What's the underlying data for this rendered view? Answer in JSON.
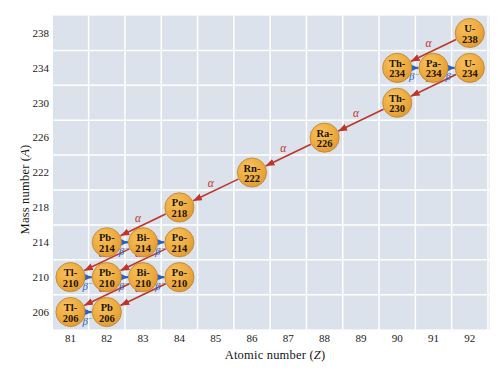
{
  "figure": {
    "xlabel_prefix": "Atomic number (",
    "xlabel_var": "Z",
    "xlabel_suffix": ")",
    "ylabel_prefix": "Mass number (",
    "ylabel_var": "A",
    "ylabel_suffix": ")"
  },
  "chart_data": {
    "type": "scatter",
    "xlabel": "Atomic number (Z)",
    "ylabel": "Mass number (A)",
    "xlim": [
      80.5,
      92.5
    ],
    "ylim": [
      204,
      240
    ],
    "grid": true,
    "x_ticks": [
      81,
      82,
      83,
      84,
      85,
      86,
      87,
      88,
      89,
      90,
      91,
      92
    ],
    "y_ticks": [
      238,
      234,
      230,
      226,
      222,
      218,
      214,
      210,
      206
    ],
    "decay_labels": {
      "alpha": "α",
      "beta": "β",
      "beta_superscript": "−"
    },
    "nuclides": [
      {
        "name": "U-238",
        "line1": "U-",
        "line2": "238",
        "z": 92,
        "a": 238
      },
      {
        "name": "Th-234",
        "line1": "Th-",
        "line2": "234",
        "z": 90,
        "a": 234
      },
      {
        "name": "Pa-234",
        "line1": "Pa-",
        "line2": "234",
        "z": 91,
        "a": 234
      },
      {
        "name": "U-234",
        "line1": "U-",
        "line2": "234",
        "z": 92,
        "a": 234
      },
      {
        "name": "Th-230",
        "line1": "Th-",
        "line2": "230",
        "z": 90,
        "a": 230
      },
      {
        "name": "Ra-226",
        "line1": "Ra-",
        "line2": "226",
        "z": 88,
        "a": 226
      },
      {
        "name": "Rn-222",
        "line1": "Rn-",
        "line2": "222",
        "z": 86,
        "a": 222
      },
      {
        "name": "Po-218",
        "line1": "Po-",
        "line2": "218",
        "z": 84,
        "a": 218
      },
      {
        "name": "Pb-214",
        "line1": "Pb-",
        "line2": "214",
        "z": 82,
        "a": 214
      },
      {
        "name": "Bi-214",
        "line1": "Bi-",
        "line2": "214",
        "z": 83,
        "a": 214
      },
      {
        "name": "Po-214",
        "line1": "Po-",
        "line2": "214",
        "z": 84,
        "a": 214
      },
      {
        "name": "Tl-210",
        "line1": "Tl-",
        "line2": "210",
        "z": 81,
        "a": 210
      },
      {
        "name": "Pb-210",
        "line1": "Pb-",
        "line2": "210",
        "z": 82,
        "a": 210
      },
      {
        "name": "Bi-210",
        "line1": "Bi-",
        "line2": "210",
        "z": 83,
        "a": 210
      },
      {
        "name": "Po-210",
        "line1": "Po-",
        "line2": "210",
        "z": 84,
        "a": 210
      },
      {
        "name": "Tl-206",
        "line1": "Tl-",
        "line2": "206",
        "z": 81,
        "a": 206
      },
      {
        "name": "Pb-206",
        "line1": "Pb",
        "line2": "206",
        "z": 82,
        "a": 206
      }
    ],
    "decays": [
      {
        "from": "U-238",
        "to": "Th-234",
        "type": "alpha"
      },
      {
        "from": "Th-234",
        "to": "Pa-234",
        "type": "beta"
      },
      {
        "from": "Pa-234",
        "to": "U-234",
        "type": "beta"
      },
      {
        "from": "U-234",
        "to": "Th-230",
        "type": "alpha"
      },
      {
        "from": "Th-230",
        "to": "Ra-226",
        "type": "alpha"
      },
      {
        "from": "Ra-226",
        "to": "Rn-222",
        "type": "alpha"
      },
      {
        "from": "Rn-222",
        "to": "Po-218",
        "type": "alpha"
      },
      {
        "from": "Po-218",
        "to": "Pb-214",
        "type": "alpha"
      },
      {
        "from": "Pb-214",
        "to": "Bi-214",
        "type": "beta"
      },
      {
        "from": "Bi-214",
        "to": "Po-214",
        "type": "beta"
      },
      {
        "from": "Bi-214",
        "to": "Tl-210",
        "type": "alpha"
      },
      {
        "from": "Po-214",
        "to": "Pb-210",
        "type": "alpha"
      },
      {
        "from": "Tl-210",
        "to": "Pb-210",
        "type": "beta"
      },
      {
        "from": "Pb-210",
        "to": "Bi-210",
        "type": "beta"
      },
      {
        "from": "Bi-210",
        "to": "Po-210",
        "type": "beta"
      },
      {
        "from": "Bi-210",
        "to": "Tl-206",
        "type": "alpha"
      },
      {
        "from": "Po-210",
        "to": "Pb-206",
        "type": "alpha"
      },
      {
        "from": "Tl-206",
        "to": "Pb-206",
        "type": "beta"
      }
    ],
    "colors": {
      "plot_bg": "#dbe2ec",
      "grid": "#ffffff",
      "nuclide_fill": "#eeab3f",
      "nuclide_highlight": "#f6c160",
      "nuclide_edge": "#dd9832",
      "nuclide_stroke": "#bb812b",
      "nuclide_text": "#211303",
      "alpha": "#c03528",
      "beta": "#2b5fc0",
      "axis_text": "#1b1b1b"
    }
  }
}
